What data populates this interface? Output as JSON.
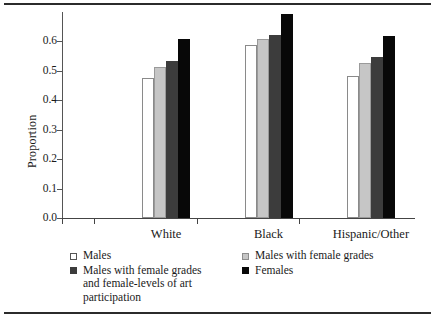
{
  "figure": {
    "top_rule": "horizontal-rule",
    "bottom_rule": "horizontal-rule"
  },
  "chart_data": {
    "type": "bar",
    "title": "",
    "subtitle": "",
    "xlabel": "",
    "ylabel": "Proportion",
    "categories": [
      "White",
      "Black",
      "Hispanic/Other"
    ],
    "series": [
      {
        "name": "Males",
        "color": "#ffffff",
        "values": [
          0.475,
          0.588,
          0.481
        ]
      },
      {
        "name": "Males with female grades",
        "color": "#c6c6c6",
        "values": [
          0.512,
          0.607,
          0.527
        ]
      },
      {
        "name": "Males with female grades and female-levels of art participation",
        "color": "#3c3c3c",
        "values": [
          0.533,
          0.622,
          0.546
        ]
      },
      {
        "name": "Females",
        "color": "#080808",
        "values": [
          0.61,
          0.692,
          0.62
        ]
      }
    ],
    "ylim": [
      0.0,
      0.7
    ],
    "ytick_values": [
      0.0,
      0.1,
      0.2,
      0.3,
      0.4,
      0.5,
      0.6
    ],
    "ytick_labels": [
      "0.0",
      "0.1",
      "0.2",
      "0.3",
      "0.4",
      "0.5",
      "0.6"
    ],
    "grid": false,
    "legend_position": "below-plot-two-columns"
  },
  "legend": {
    "columns": [
      {
        "entries": [
          {
            "swatch": "open-square-white",
            "label": "Males"
          },
          {
            "swatch": "filled-square-dark-gray",
            "label": "Males with female grades\nand female-levels of art\nparticipation"
          }
        ]
      },
      {
        "entries": [
          {
            "swatch": "filled-square-light-gray",
            "label": "Males with female grades"
          },
          {
            "swatch": "filled-square-black",
            "label": "Females"
          }
        ]
      }
    ]
  }
}
